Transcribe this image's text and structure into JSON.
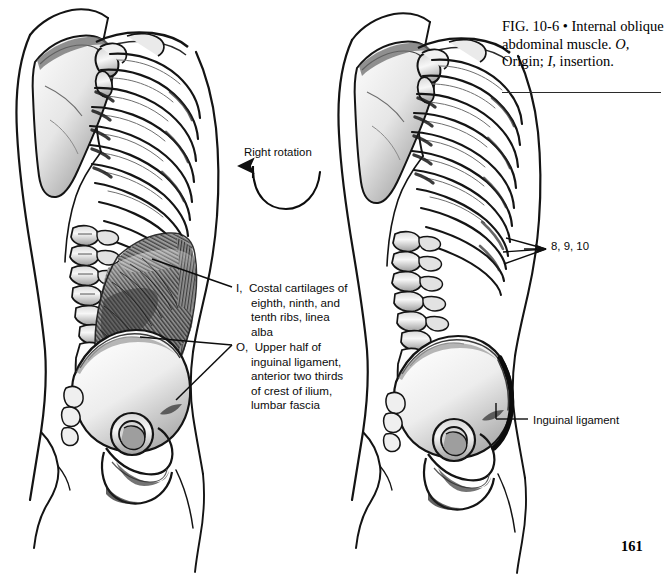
{
  "page": {
    "number": "161",
    "background": "#ffffff",
    "ink": "#111111"
  },
  "caption": {
    "fig_number": "FIG. 10-6",
    "bullet": "•",
    "title": "Internal oblique abdominal muscle.",
    "key_origin_letter": "O,",
    "key_origin_word": "Origin;",
    "key_insertion_letter": "I,",
    "key_insertion_word": "insertion.",
    "full_text": "FIG. 10-6 • Internal oblique abdominal muscle. O, Origin; I, insertion."
  },
  "figures": {
    "left": {
      "name": "internal-oblique-muscle-view",
      "description": "Lateral view of torso skeleton with internal oblique abdominal muscle shown",
      "annotations": {
        "rotation": {
          "label": "Right rotation",
          "arrow": "curved-u-arrow-counterclockwise"
        },
        "insertion": {
          "key": "I,",
          "line1": "Costal cartilages of",
          "line2": "eighth, ninth, and",
          "line3": "tenth ribs, linea",
          "line4": "alba",
          "full_text": "I, Costal cartilages of eighth, ninth, and tenth ribs, linea alba"
        },
        "origin": {
          "key": "O,",
          "line1": "Upper half of",
          "line2": "inguinal ligament,",
          "line3": "anterior two thirds",
          "line4": "of crest of ilium,",
          "line5": "lumbar fascia",
          "full_text": "O, Upper half of inguinal ligament, anterior two thirds of crest of ilium, lumbar fascia"
        }
      }
    },
    "right": {
      "name": "skeleton-reference-view",
      "description": "Lateral view of torso skeleton without muscle, showing rib and ligament attachments",
      "annotations": {
        "ribs": {
          "label": "8, 9, 10",
          "leader": "three-pronged-arrow"
        },
        "ligament": {
          "label": "Inguinal ligament",
          "leader": "elbow-line"
        }
      }
    }
  }
}
